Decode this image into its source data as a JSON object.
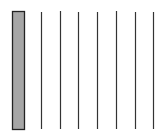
{
  "diagram": {
    "background": "#ffffff",
    "filled_bar": {
      "x": 12,
      "y": 11,
      "width": 12,
      "height": 118,
      "fill": "#a6a6a6",
      "stroke": "#222222"
    },
    "lines": [
      {
        "x": 41,
        "y1": 12,
        "y2": 129
      },
      {
        "x": 60,
        "y1": 11,
        "y2": 129
      },
      {
        "x": 78,
        "y1": 12,
        "y2": 129
      },
      {
        "x": 97,
        "y1": 12,
        "y2": 129
      },
      {
        "x": 116,
        "y1": 11,
        "y2": 129
      },
      {
        "x": 135,
        "y1": 12,
        "y2": 129
      },
      {
        "x": 153,
        "y1": 12,
        "y2": 129
      }
    ],
    "line_color": "#333333"
  }
}
